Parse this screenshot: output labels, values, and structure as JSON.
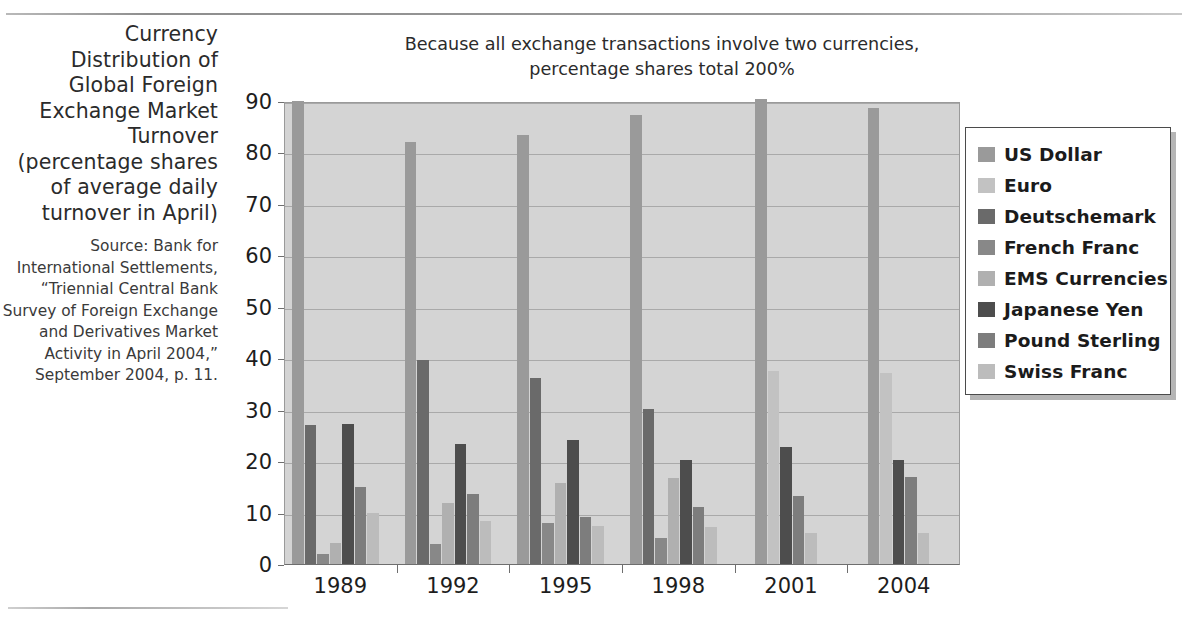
{
  "figure": {
    "title": "Currency Distribution of Global Foreign Exchange Market Turnover (percentage shares of average daily turnover in April)",
    "source": "Source: Bank for International Settlements, “Triennial Central Bank Survey of Foreign Exchange and Derivatives Market Activity in April 2004,” September 2004, p. 11."
  },
  "chart_data": {
    "type": "bar",
    "title": "Because all exchange transactions involve two currencies, percentage shares total 200%",
    "xlabel": "",
    "ylabel": "",
    "ylim": [
      0,
      90
    ],
    "yticks": [
      0,
      10,
      20,
      30,
      40,
      50,
      60,
      70,
      80,
      90
    ],
    "grid": true,
    "legend_position": "right",
    "categories": [
      "1989",
      "1992",
      "1995",
      "1998",
      "2001",
      "2004"
    ],
    "series": [
      {
        "name": "US Dollar",
        "color": "#9a9a9a",
        "values": [
          90.0,
          82.0,
          83.3,
          87.3,
          90.3,
          88.7
        ]
      },
      {
        "name": "Euro",
        "color": "#c2c2c2",
        "values": [
          null,
          null,
          null,
          null,
          37.6,
          37.2
        ]
      },
      {
        "name": "Deutschemark",
        "color": "#6a6a6a",
        "values": [
          27.0,
          39.6,
          36.1,
          30.1,
          null,
          null
        ]
      },
      {
        "name": "French Franc",
        "color": "#888888",
        "values": [
          2.0,
          3.8,
          7.9,
          5.1,
          null,
          null
        ]
      },
      {
        "name": "EMS Currencies",
        "color": "#b0b0b0",
        "values": [
          4.0,
          11.8,
          15.7,
          16.7,
          null,
          null
        ]
      },
      {
        "name": "Japanese Yen",
        "color": "#4d4d4d",
        "values": [
          27.2,
          23.4,
          24.1,
          20.2,
          22.7,
          20.3
        ]
      },
      {
        "name": "Pound Sterling",
        "color": "#7d7d7d",
        "values": [
          15.0,
          13.6,
          9.1,
          11.0,
          13.2,
          16.9
        ]
      },
      {
        "name": "Swiss Franc",
        "color": "#bcbcbc",
        "values": [
          10.0,
          8.4,
          7.3,
          7.1,
          6.1,
          6.1
        ]
      }
    ]
  },
  "legend": {
    "items": [
      {
        "label": "US Dollar"
      },
      {
        "label": "Euro"
      },
      {
        "label": "Deutschemark"
      },
      {
        "label": "French Franc"
      },
      {
        "label": "EMS Currencies"
      },
      {
        "label": "Japanese Yen"
      },
      {
        "label": "Pound Sterling"
      },
      {
        "label": "Swiss Franc"
      }
    ]
  },
  "colors": {
    "plot_background": "#d4d4d4",
    "gridline": "#a9a9a9",
    "axis": "#6e6e6e",
    "text": "#1d1d1d"
  }
}
